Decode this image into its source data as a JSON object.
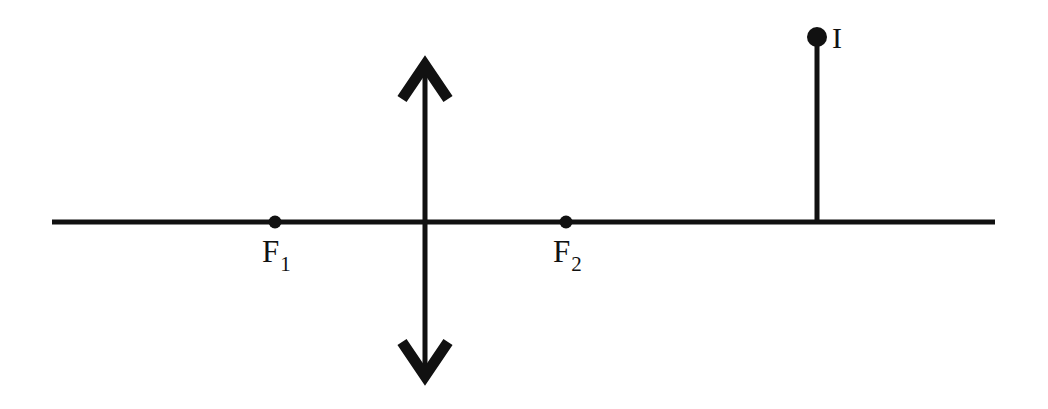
{
  "figure": {
    "background_color": "#ffffff",
    "stroke_color": "#111111",
    "width": 1048,
    "height": 409
  },
  "optical_axis": {
    "name": "principal axis",
    "x1": 52,
    "y1": 222,
    "x2": 995,
    "y2": 222,
    "thickness": 5
  },
  "lens": {
    "name": "converging lens",
    "x": 425,
    "top_tip_y": 63,
    "bottom_tip_y": 378,
    "thickness": 5,
    "arrowhead_half_width": 23,
    "arrowhead_height": 28,
    "arrow_style": "double-headed open chevron"
  },
  "points": [
    {
      "id": "f1",
      "base": "F",
      "subscript": "1",
      "x": 275,
      "y": 222,
      "dot_radius": 6.5,
      "label_x": 262,
      "label_y": 236
    },
    {
      "id": "f2",
      "base": "F",
      "subscript": "2",
      "x": 566,
      "y": 222,
      "dot_radius": 6.5,
      "label_x": 553,
      "label_y": 236
    }
  ],
  "image": {
    "id": "image-point",
    "label": "I",
    "x": 817,
    "top_y": 37,
    "base_y": 222,
    "dot_radius": 10,
    "thickness": 5,
    "label_x": 832,
    "label_y": 23
  }
}
